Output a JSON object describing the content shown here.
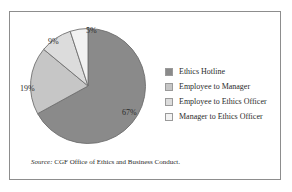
{
  "figure": {
    "border_color": "#8d8d8d",
    "background": "#ffffff"
  },
  "source": {
    "prefix": "Source:",
    "text": "CGF Office of Ethics and Business Conduct."
  },
  "legend": {
    "items": [
      {
        "label": "Ethics Hotline",
        "color": "#8a8a8a"
      },
      {
        "label": "Employee to Manager",
        "color": "#c6c6c6"
      },
      {
        "label": "Employee to Ethics Officer",
        "color": "#dcdcdc"
      },
      {
        "label": "Manager to Ethics Officer",
        "color": "#f2f2f2"
      }
    ]
  },
  "chart_data": {
    "type": "pie",
    "title": "",
    "categories": [
      "Ethics Hotline",
      "Employee to Manager",
      "Employee to Ethics Officer",
      "Manager to Ethics Officer"
    ],
    "values": [
      67,
      19,
      9,
      5
    ],
    "labels": [
      "67%",
      "19%",
      "9%",
      "5%"
    ],
    "colors": [
      "#8a8a8a",
      "#c6c6c6",
      "#dcdcdc",
      "#f2f2f2"
    ],
    "unit": "percent",
    "start_angle_deg": 0,
    "direction": "clockwise",
    "grid": false,
    "legend_position": "right",
    "xlabel": "",
    "ylabel": ""
  }
}
